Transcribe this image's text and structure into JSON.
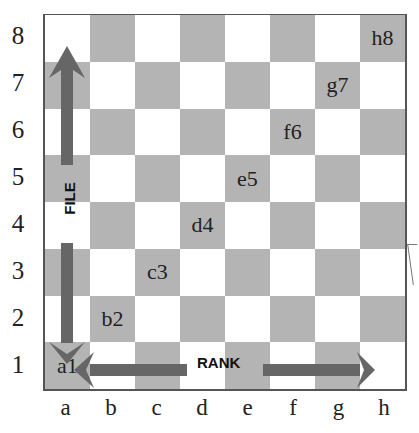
{
  "diagram": {
    "type": "chessboard-coordinates",
    "colors": {
      "dark_square": "#b4b4b4",
      "light_square": "#ffffff",
      "arrow": "#666666",
      "border": "#555555"
    },
    "rank_labels": [
      "8",
      "7",
      "6",
      "5",
      "4",
      "3",
      "2",
      "1"
    ],
    "file_labels": [
      "a",
      "b",
      "c",
      "d",
      "e",
      "f",
      "g",
      "h"
    ],
    "squares": [
      [
        "",
        "",
        "",
        "",
        "",
        "",
        "",
        "h8"
      ],
      [
        "",
        "",
        "",
        "",
        "",
        "",
        "g7",
        ""
      ],
      [
        "",
        "",
        "",
        "",
        "",
        "f6",
        "",
        ""
      ],
      [
        "",
        "",
        "",
        "",
        "e5",
        "",
        "",
        ""
      ],
      [
        "",
        "",
        "",
        "d4",
        "",
        "",
        "",
        ""
      ],
      [
        "",
        "",
        "c3",
        "",
        "",
        "",
        "",
        ""
      ],
      [
        "",
        "b2",
        "",
        "",
        "",
        "",
        "",
        ""
      ],
      [
        "a1",
        "",
        "",
        "",
        "",
        "",
        "",
        ""
      ]
    ],
    "arrows": {
      "vertical_label": "FILE",
      "horizontal_label": "RANK"
    }
  }
}
